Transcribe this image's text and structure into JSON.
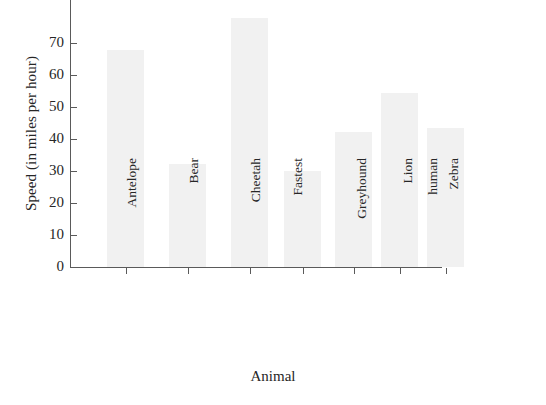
{
  "chart_data": {
    "type": "bar",
    "title": "",
    "xlabel": "Animal",
    "ylabel": "Speed (in miles per hour)",
    "categories": [
      "Antelope",
      "Bear",
      "Cheetah",
      "Fastest human",
      "Greyhound",
      "Lion",
      "Zebra"
    ],
    "values": [
      61,
      29,
      70,
      27,
      38,
      49,
      39
    ],
    "ylim": [
      0,
      75
    ],
    "yticks": [
      0,
      10,
      20,
      30,
      40,
      50,
      60,
      70
    ],
    "ytick_labels": [
      "0",
      "10",
      "20",
      "30",
      "40",
      "50",
      "60",
      "70"
    ],
    "grid": false,
    "legend": null,
    "bar_color": "#f1f1f1",
    "axis_color": "#5a5a5a",
    "text_color": "#262626"
  },
  "axes": {
    "y_title": "Speed (in miles per hour)",
    "x_title": "Animal"
  },
  "x_labels": [
    {
      "line1": "Antelope",
      "line2": ""
    },
    {
      "line1": "Bear",
      "line2": ""
    },
    {
      "line1": "Cheetah",
      "line2": ""
    },
    {
      "line1": "Fastest",
      "line2": "human"
    },
    {
      "line1": "Greyhound",
      "line2": ""
    },
    {
      "line1": "Lion",
      "line2": ""
    },
    {
      "line1": "Zebra",
      "line2": ""
    }
  ],
  "y_labels": [
    "70",
    "60",
    "50",
    "40",
    "30",
    "20",
    "10",
    "0"
  ]
}
